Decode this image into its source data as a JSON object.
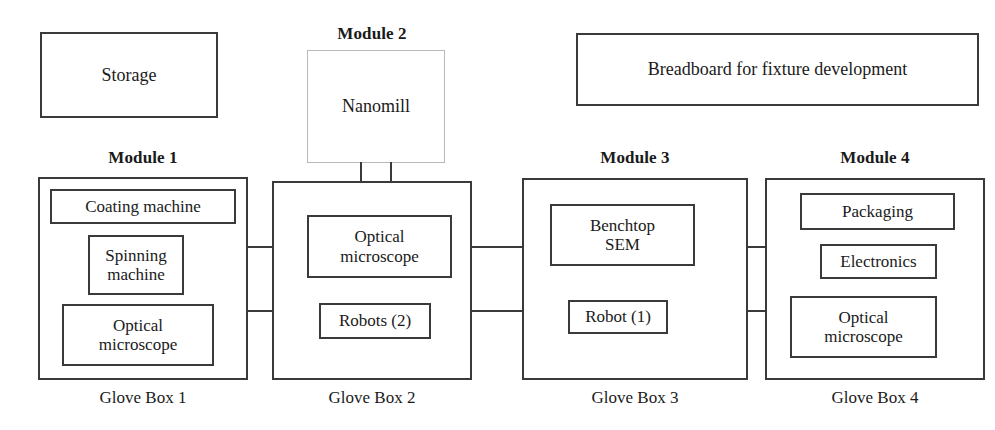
{
  "diagram": {
    "standalone_boxes": [
      {
        "name": "storage",
        "label": "Storage"
      },
      {
        "name": "breadboard",
        "label": "Breadboard for fixture development"
      },
      {
        "name": "nanomill",
        "label": "Nanomill"
      }
    ],
    "modules": [
      {
        "id": "module-1",
        "title": "Module 1",
        "caption": "Glove Box 1",
        "items": [
          {
            "label": "Coating machine"
          },
          {
            "label": "Spinning\nmachine"
          },
          {
            "label": "Optical\nmicroscope"
          }
        ]
      },
      {
        "id": "module-2",
        "title": "Module 2",
        "caption": "Glove Box 2",
        "items": [
          {
            "label": "Optical\nmicroscope"
          },
          {
            "label": "Robots (2)"
          }
        ]
      },
      {
        "id": "module-3",
        "title": "Module 3",
        "caption": "Glove Box 3",
        "items": [
          {
            "label": "Benchtop\nSEM"
          },
          {
            "label": "Robot (1)"
          }
        ]
      },
      {
        "id": "module-4",
        "title": "Module 4",
        "caption": "Glove Box 4",
        "items": [
          {
            "label": "Packaging"
          },
          {
            "label": "Electronics"
          },
          {
            "label": "Optical\nmicroscope"
          }
        ]
      }
    ],
    "connectors": [
      {
        "name": "connector-gb1-gb2",
        "from": "Glove Box 1",
        "to": "Glove Box 2"
      },
      {
        "name": "connector-gb2-gb3",
        "from": "Glove Box 2",
        "to": "Glove Box 3"
      },
      {
        "name": "connector-gb3-gb4",
        "from": "Glove Box 3",
        "to": "Glove Box 4"
      },
      {
        "name": "connector-nanomill-gb2",
        "from": "Nanomill",
        "to": "Glove Box 2"
      }
    ],
    "colors": {
      "stroke": "#3a3a3a",
      "stroke_light": "#b8b8b8",
      "background": "#ffffff",
      "text": "#1a1a1a"
    }
  }
}
